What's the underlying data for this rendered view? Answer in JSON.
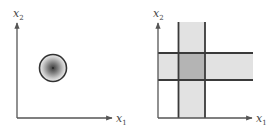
{
  "figure": {
    "colors": {
      "axis": "#555555",
      "band_line": "#3a3a3a",
      "band_fill": "#e2e2e2",
      "overlap_fill": "#b4b4b4",
      "circle_stroke": "#333333",
      "circle_center": "#3c3c3c",
      "circle_edge": "#f0f0f0",
      "label": "#444444"
    },
    "panels": [
      {
        "id": "left",
        "description": "Circular (radially symmetric) region in the x1-x2 plane",
        "x_axis": {
          "label_base": "x",
          "label_sub": "1"
        },
        "y_axis": {
          "label_base": "x",
          "label_sub": "2"
        },
        "shape": "gradient-circle"
      },
      {
        "id": "right",
        "description": "Intersection of vertical and horizontal bands forming a rectangular overlap region",
        "x_axis": {
          "label_base": "x",
          "label_sub": "1"
        },
        "y_axis": {
          "label_base": "x",
          "label_sub": "2"
        },
        "shape": "crossing-bands"
      }
    ]
  }
}
